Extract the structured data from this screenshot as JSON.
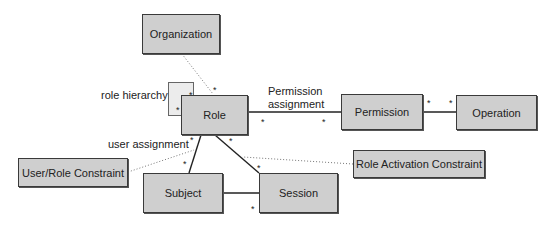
{
  "diagram": {
    "title": "",
    "nodes": [
      {
        "id": "organization",
        "label": "Organization",
        "x": 142,
        "y": 14,
        "w": 78,
        "h": 40
      },
      {
        "id": "role-hierarchy-box",
        "label": "",
        "x": 168,
        "y": 82,
        "w": 26,
        "h": 34,
        "style": "light"
      },
      {
        "id": "role",
        "label": "Role",
        "x": 181,
        "y": 95,
        "w": 67,
        "h": 40
      },
      {
        "id": "permission",
        "label": "Permission",
        "x": 341,
        "y": 94,
        "w": 82,
        "h": 36
      },
      {
        "id": "operation",
        "label": "Operation",
        "x": 456,
        "y": 95,
        "w": 81,
        "h": 35
      },
      {
        "id": "user-role-constraint",
        "label": "User/Role Constraint",
        "x": 18,
        "y": 158,
        "w": 110,
        "h": 29
      },
      {
        "id": "subject",
        "label": "Subject",
        "x": 143,
        "y": 173,
        "w": 80,
        "h": 40
      },
      {
        "id": "session",
        "label": "Session",
        "x": 259,
        "y": 173,
        "w": 79,
        "h": 40
      },
      {
        "id": "role-activation-constraint",
        "label": "Role Activation Constraint",
        "x": 353,
        "y": 150,
        "w": 132,
        "h": 28
      }
    ],
    "edges": [
      {
        "from": "organization",
        "to": "role",
        "style": "dotted",
        "x1": 182,
        "y1": 54,
        "x2": 213,
        "y2": 94
      },
      {
        "from": "role",
        "to": "permission",
        "style": "solid",
        "x1": 248,
        "y1": 112,
        "x2": 341,
        "y2": 112
      },
      {
        "from": "permission",
        "to": "operation",
        "style": "solid",
        "x1": 423,
        "y1": 112,
        "x2": 456,
        "y2": 112
      },
      {
        "from": "role",
        "to": "subject",
        "style": "solid",
        "x1": 201,
        "y1": 135,
        "x2": 189,
        "y2": 173
      },
      {
        "from": "role",
        "to": "session",
        "style": "solid",
        "x1": 215,
        "y1": 135,
        "x2": 259,
        "y2": 173
      },
      {
        "from": "subject",
        "to": "session",
        "style": "solid",
        "x1": 223,
        "y1": 193,
        "x2": 259,
        "y2": 193
      },
      {
        "from": "user-role-constraint",
        "to": "role-subject",
        "style": "dotted",
        "x1": 128,
        "y1": 172,
        "x2": 194,
        "y2": 150
      },
      {
        "from": "role-activation-constraint",
        "to": "role-session",
        "style": "dotted",
        "x1": 353,
        "y1": 164,
        "x2": 243,
        "y2": 157
      }
    ],
    "labels": [
      {
        "id": "role-hierarchy-label",
        "text": "role hierarchy",
        "x": 101,
        "y": 89
      },
      {
        "id": "permission-assignment-label-1",
        "text": "Permission",
        "x": 268,
        "y": 85
      },
      {
        "id": "permission-assignment-label-2",
        "text": "assignment",
        "x": 268,
        "y": 98
      },
      {
        "id": "user-assignment-label",
        "text": "user assignment",
        "x": 108,
        "y": 138
      }
    ],
    "multiplicities": [
      {
        "text": "*",
        "x": 213,
        "y": 86
      },
      {
        "text": "*",
        "x": 189,
        "y": 91
      },
      {
        "text": "*",
        "x": 176,
        "y": 106
      },
      {
        "text": "*",
        "x": 261,
        "y": 118
      },
      {
        "text": "*",
        "x": 322,
        "y": 118
      },
      {
        "text": "*",
        "x": 427,
        "y": 99
      },
      {
        "text": "*",
        "x": 449,
        "y": 99
      },
      {
        "text": "*",
        "x": 190,
        "y": 136
      },
      {
        "text": "*",
        "x": 229,
        "y": 137
      },
      {
        "text": "*",
        "x": 183,
        "y": 160
      },
      {
        "text": "*",
        "x": 257,
        "y": 164
      },
      {
        "text": "*",
        "x": 251,
        "y": 205
      }
    ],
    "colors": {
      "box_fill": "#cfcfcf",
      "box_border": "#3a3a3a",
      "line": "#222222",
      "dotted": "#777777"
    }
  }
}
